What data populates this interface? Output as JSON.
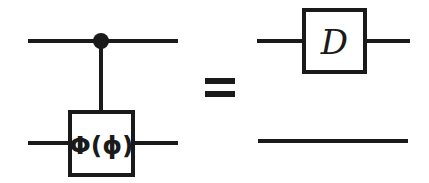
{
  "figure": {
    "background_color": "#ffffff",
    "ink_color": "#1a1a1a",
    "width": 429,
    "height": 183
  },
  "left_circuit": {
    "name": "controlled-phase-circuit",
    "control": {
      "dot_label": "control-dot",
      "wire_label": "control-qubit-wire"
    },
    "target": {
      "gate_label": "Φ(ϕ)",
      "wire_label": "target-qubit-wire"
    },
    "vertical_link_label": "control-connector"
  },
  "relation": {
    "symbol": "=",
    "name": "equality-relation"
  },
  "right_circuit": {
    "name": "displacement-circuit",
    "top": {
      "gate_label": "D",
      "wire_label": "top-qubit-wire"
    },
    "bottom": {
      "wire_label": "bottom-qubit-wire"
    }
  }
}
